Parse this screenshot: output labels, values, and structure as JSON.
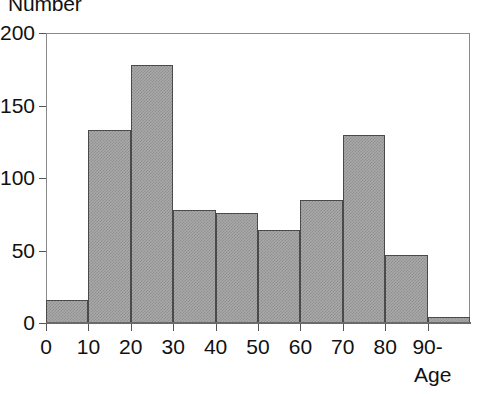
{
  "chart_data": {
    "type": "bar",
    "title": "",
    "subtitle": "",
    "ylabel": "Number",
    "xlabel": "Age",
    "grid": false,
    "legend": "none",
    "bin_width": 10,
    "categories": [
      "0-10",
      "10-20",
      "20-30",
      "30-40",
      "40-50",
      "50-60",
      "60-70",
      "70-80",
      "80-90",
      "90-"
    ],
    "bin_edges": [
      0,
      10,
      20,
      30,
      40,
      50,
      60,
      70,
      80,
      90,
      100
    ],
    "values": [
      16,
      133,
      178,
      78,
      76,
      64,
      85,
      130,
      47,
      4
    ],
    "ylim": [
      0,
      200
    ],
    "xlim": [
      0,
      100
    ],
    "yticks": [
      {
        "value": 200,
        "label": "200"
      },
      {
        "value": 150,
        "label": "150"
      },
      {
        "value": 100,
        "label": "100"
      },
      {
        "value": 50,
        "label": "50"
      },
      {
        "value": 0,
        "label": "0"
      }
    ],
    "xticks": [
      {
        "value": 0,
        "label": "0"
      },
      {
        "value": 10,
        "label": "10"
      },
      {
        "value": 20,
        "label": "20"
      },
      {
        "value": 30,
        "label": "30"
      },
      {
        "value": 40,
        "label": "40"
      },
      {
        "value": 50,
        "label": "50"
      },
      {
        "value": 60,
        "label": "60"
      },
      {
        "value": 70,
        "label": "70"
      },
      {
        "value": 80,
        "label": "80"
      },
      {
        "value": 90,
        "label": "90-"
      }
    ],
    "colors": {
      "bar_fill": "#a9a9a9",
      "bar_hatch": "#8f8f8f",
      "bar_edge": "#4a4a4a",
      "axis": "#555555",
      "frame": "#8a8a8a",
      "text": "#111111",
      "background": "#ffffff"
    }
  }
}
